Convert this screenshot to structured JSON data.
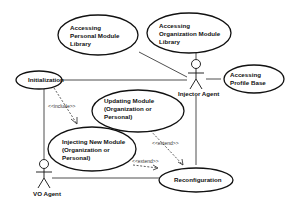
{
  "diagram": {
    "type": "UML use case diagram",
    "actors": [
      {
        "id": "injector",
        "label": "Injector Agent"
      },
      {
        "id": "vo",
        "label": "VO Agent"
      }
    ],
    "use_cases": [
      {
        "id": "personal_lib",
        "lines": [
          "Accessing",
          "Personal Module",
          "Library"
        ]
      },
      {
        "id": "org_lib",
        "lines": [
          "Accessing",
          "Organization Module",
          "Library"
        ]
      },
      {
        "id": "profile",
        "lines": [
          "Accessing",
          "Profile Base"
        ]
      },
      {
        "id": "init",
        "lines": [
          "Initialization"
        ]
      },
      {
        "id": "update",
        "lines": [
          "Updating Module",
          "(Organization or",
          "Personal)"
        ]
      },
      {
        "id": "inject",
        "lines": [
          "Injecting New Module",
          "(Organization or",
          "Personal)"
        ]
      },
      {
        "id": "reconfig",
        "lines": [
          "Reconfiguration"
        ]
      }
    ],
    "relations": [
      {
        "from": "init",
        "to": "inject",
        "type": "include",
        "label": "<<include>>"
      },
      {
        "from": "update",
        "to": "reconfig",
        "type": "extend",
        "label": "<<extend>>"
      },
      {
        "from": "inject",
        "to": "reconfig",
        "type": "extend",
        "label": "<<extend>>"
      }
    ],
    "associations": [
      [
        "injector",
        "personal_lib"
      ],
      [
        "injector",
        "org_lib"
      ],
      [
        "injector",
        "profile"
      ],
      [
        "injector",
        "init"
      ],
      [
        "injector",
        "reconfig"
      ],
      [
        "vo",
        "init"
      ],
      [
        "vo",
        "reconfig"
      ]
    ]
  }
}
